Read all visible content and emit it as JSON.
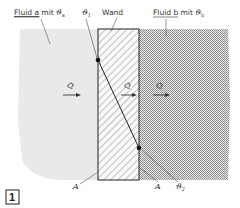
{
  "diagram": {
    "title_labels": {
      "fluid_a": "Fluid a",
      "fluid_a_suffix": " mit ",
      "theta_a": "ϑ",
      "theta_a_sub": "a",
      "theta_1": "ϑ",
      "theta_1_sub": "1",
      "wall": "Wand",
      "fluid_b": "Fluid b",
      "fluid_b_suffix": " mit ",
      "theta_b": "ϑ",
      "theta_b_sub": "b"
    },
    "heat_flow_labels": [
      "Q̇",
      "Q̇",
      "Q̇"
    ],
    "area_labels": [
      "A",
      "A"
    ],
    "theta_2": "ϑ",
    "theta_2_sub": "2",
    "figure_number": "1",
    "colors": {
      "fluid_a": "#e9e9e9",
      "fluid_b": "#cfcfcf",
      "wall_hatch": "#555555",
      "line": "#222222"
    }
  }
}
